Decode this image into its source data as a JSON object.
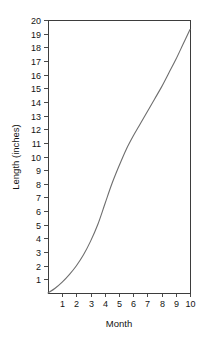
{
  "chart_data": {
    "type": "line",
    "title": "",
    "xlabel": "Month",
    "ylabel": "Length (inches)",
    "xlim": [
      0,
      10
    ],
    "ylim": [
      0,
      20
    ],
    "grid": false,
    "legend": false,
    "x_ticks": [
      "1",
      "2",
      "3",
      "4",
      "5",
      "6",
      "7",
      "8",
      "9",
      "10"
    ],
    "x_tick_values": [
      1,
      2,
      3,
      4,
      5,
      6,
      7,
      8,
      9,
      10
    ],
    "y_ticks": [
      "1",
      "2",
      "3",
      "4",
      "5",
      "6",
      "7",
      "8",
      "9",
      "10",
      "11",
      "12",
      "13",
      "14",
      "15",
      "16",
      "17",
      "18",
      "19",
      "20"
    ],
    "y_tick_values": [
      1,
      2,
      3,
      4,
      5,
      6,
      7,
      8,
      9,
      10,
      11,
      12,
      13,
      14,
      15,
      16,
      17,
      18,
      19,
      20
    ],
    "series": [
      {
        "name": "growth",
        "color": "#6e6e6e",
        "x": [
          0,
          0.5,
          1,
          1.5,
          2,
          2.5,
          3,
          3.5,
          4,
          4.5,
          5,
          5.5,
          6,
          6.5,
          7,
          7.5,
          8,
          8.5,
          9,
          9.5,
          10
        ],
        "y": [
          0,
          0.35,
          0.8,
          1.35,
          2.0,
          2.8,
          3.8,
          5.0,
          6.5,
          8.0,
          9.3,
          10.5,
          11.5,
          12.4,
          13.3,
          14.2,
          15.1,
          16.1,
          17.1,
          18.2,
          19.3
        ]
      }
    ],
    "colors": {
      "curve": "#6e6e6e",
      "frame": "#3d3d3d",
      "text": "#141414",
      "background": "#ffffff"
    }
  },
  "plot": {
    "left": 48,
    "right": 190,
    "top": 20,
    "bottom": 293
  }
}
